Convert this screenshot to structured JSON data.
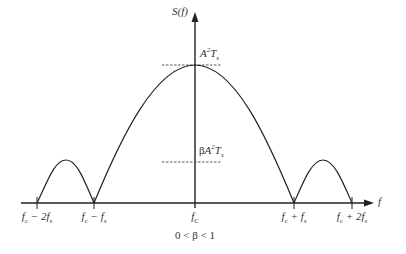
{
  "diagram": {
    "type": "power-spectral-density",
    "y_axis_label": "S(f)",
    "x_axis_label": "f",
    "peak_label": {
      "base": "A",
      "sup": "2",
      "mid": "T",
      "sub": "s"
    },
    "beta_label": {
      "prefix": "β",
      "base": "A",
      "sup": "2",
      "mid": "T",
      "sub": "s"
    },
    "condition": "0 < β < 1",
    "ticks": [
      {
        "id": "fc-2fs",
        "f": "f",
        "sub": "c",
        "rest": " − 2f",
        "rest_sub": "s",
        "x": 37
      },
      {
        "id": "fc-fs",
        "f": "f",
        "sub": "c",
        "rest": " − f",
        "rest_sub": "s",
        "x": 94
      },
      {
        "id": "fc",
        "f": "f",
        "sub": "C",
        "rest": "",
        "rest_sub": "",
        "x": 195
      },
      {
        "id": "fc+fs",
        "f": "f",
        "sub": "c",
        "rest": " + f",
        "rest_sub": "s",
        "x": 294
      },
      {
        "id": "fc+2fs",
        "f": "f",
        "sub": "c",
        "rest": " + 2f",
        "rest_sub": "s",
        "x": 352
      }
    ],
    "colors": {
      "line": "#222222",
      "dashed": "#444444"
    }
  }
}
